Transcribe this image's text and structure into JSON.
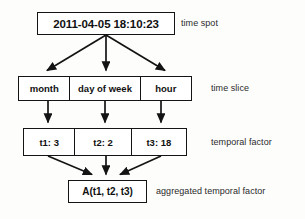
{
  "diagram": {
    "colors": {
      "stroke": "#141414",
      "box_fill": "#ffffff",
      "text": "#111111",
      "label_text": "#2b2b2b",
      "background": "#fdfdfc"
    },
    "levels": [
      {
        "id": "time-spot",
        "label": "time spot",
        "nodes": [
          {
            "id": "timestamp",
            "text": "2011-04-05 18:10:23"
          }
        ]
      },
      {
        "id": "time-slice",
        "label": "time slice",
        "nodes": [
          {
            "id": "month",
            "text": "month"
          },
          {
            "id": "day-of-week",
            "text": "day of week"
          },
          {
            "id": "hour",
            "text": "hour"
          }
        ]
      },
      {
        "id": "temporal-factor",
        "label": "temporal factor",
        "nodes": [
          {
            "id": "t1",
            "text": "t1: 3"
          },
          {
            "id": "t2",
            "text": "t2: 2"
          },
          {
            "id": "t3",
            "text": "t3: 18"
          }
        ]
      },
      {
        "id": "aggregated-temporal-factor",
        "label": "aggregated temporal factor",
        "nodes": [
          {
            "id": "aggregate",
            "text": "A(t1, t2, t3)"
          }
        ]
      }
    ]
  }
}
